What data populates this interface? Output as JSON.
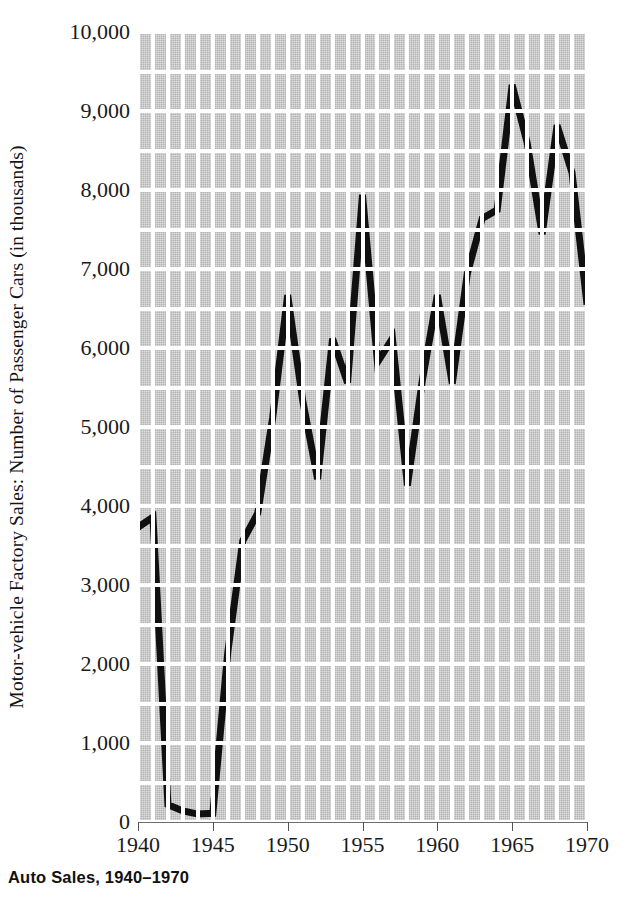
{
  "caption": "Auto Sales, 1940–1970",
  "axes": {
    "ylabel": "Motor-vehicle Factory Sales: Number of Passenger Cars (in thousands)",
    "yticks": [
      "0",
      "1,000",
      "2,000",
      "3,000",
      "4,000",
      "5,000",
      "6,000",
      "7,000",
      "8,000",
      "9,000",
      "10,000"
    ],
    "ytick_values": [
      0,
      1000,
      2000,
      3000,
      4000,
      5000,
      6000,
      7000,
      8000,
      9000,
      10000
    ],
    "xticks": [
      "1940",
      "1945",
      "1950",
      "1955",
      "1960",
      "1965",
      "1970"
    ],
    "xtick_values": [
      1940,
      1945,
      1950,
      1955,
      1960,
      1965,
      1970
    ]
  },
  "colors": {
    "plot_background": "#b4b4b4",
    "gridline": "#ffffff",
    "series_line": "#101010",
    "axis": "#555555",
    "text": "#1a1a1a"
  },
  "chart_data": {
    "type": "line",
    "title": "Auto Sales, 1940–1970",
    "xlabel": "",
    "ylabel": "Motor-vehicle Factory Sales: Number of Passenger Cars (in thousands)",
    "xlim": [
      1940,
      1970
    ],
    "ylim": [
      0,
      10000
    ],
    "grid": true,
    "legend": "none",
    "x": [
      1940,
      1941,
      1942,
      1943,
      1944,
      1945,
      1946,
      1947,
      1948,
      1949,
      1950,
      1951,
      1952,
      1953,
      1954,
      1955,
      1956,
      1957,
      1958,
      1959,
      1960,
      1961,
      1962,
      1963,
      1964,
      1965,
      1966,
      1967,
      1968,
      1969,
      1970
    ],
    "series": [
      {
        "name": "Passenger cars (thousands)",
        "values": [
          3730,
          3860,
          220,
          140,
          100,
          110,
          2150,
          3560,
          3910,
          5120,
          6670,
          5340,
          4340,
          6120,
          5560,
          7940,
          5820,
          6120,
          4260,
          5590,
          6670,
          5550,
          6940,
          7640,
          7750,
          9330,
          8600,
          7440,
          8820,
          8220,
          6550
        ]
      }
    ]
  },
  "grid_layout": {
    "h_gridlines_per_1000": 2,
    "v_gridline_spacing_years": 1
  }
}
